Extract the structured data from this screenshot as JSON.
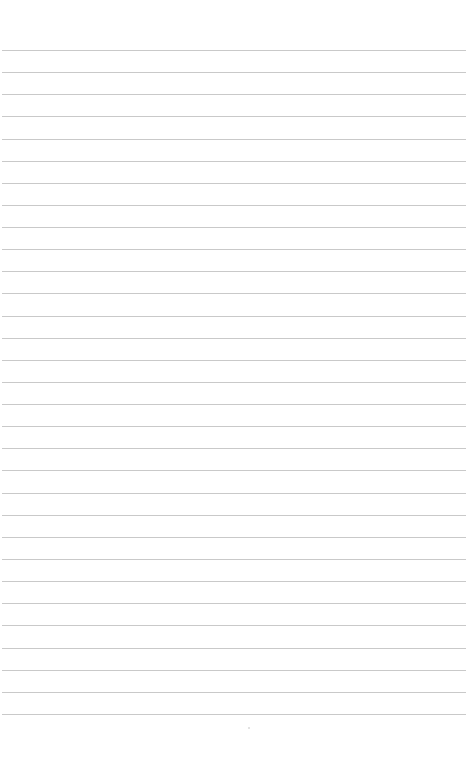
{
  "page": {
    "type": "lined-paper",
    "background": "#ffffff",
    "line_color": "#c9c9c9",
    "first_line_y": 50,
    "line_spacing": 22.13,
    "line_count": 31,
    "content": []
  }
}
